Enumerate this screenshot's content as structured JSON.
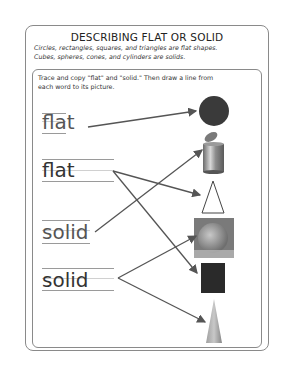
{
  "worksheet": {
    "title": "DESCRIBING FLAT OR SOLID",
    "intro_line1": "Circles, rectangles, squares, and triangles are flat shapes.",
    "intro_line2": "Cubes, spheres, cones, and cylinders are solids.",
    "instructions_line1": "Trace and copy \"flat\" and \"solid.\"  Then draw a line from",
    "instructions_line2": "each word to its picture.",
    "words": [
      {
        "text": "flat",
        "style": "traced"
      },
      {
        "text": "flat",
        "style": "copied"
      },
      {
        "text": "solid",
        "style": "traced"
      },
      {
        "text": "solid",
        "style": "copied"
      }
    ],
    "pictures": [
      {
        "name": "circle",
        "type": "flat",
        "color": "#3a3a3a"
      },
      {
        "name": "trash-can-cylinder",
        "type": "solid"
      },
      {
        "name": "triangle",
        "type": "flat"
      },
      {
        "name": "orange-sphere",
        "type": "solid"
      },
      {
        "name": "square",
        "type": "flat",
        "color": "#2a2a2a"
      },
      {
        "name": "cone",
        "type": "solid"
      }
    ],
    "connections": [
      {
        "from": "flat-1",
        "to": "circle"
      },
      {
        "from": "flat-2",
        "to": "triangle"
      },
      {
        "from": "flat-2",
        "to": "square"
      },
      {
        "from": "solid-1",
        "to": "trash-can-cylinder"
      },
      {
        "from": "solid-2",
        "to": "orange-sphere"
      },
      {
        "from": "solid-2",
        "to": "cone"
      }
    ]
  }
}
